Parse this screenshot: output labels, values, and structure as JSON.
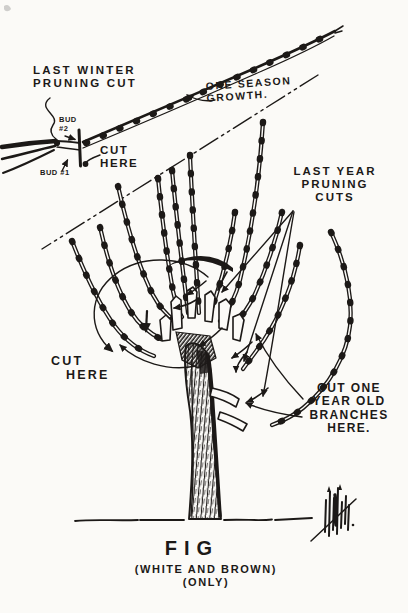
{
  "meta": {
    "paper_color": "#fbfaf7",
    "ink_color": "#1c1917",
    "illustration": "hand-drawn fig tree pruning diagram"
  },
  "inset": {
    "last_winter_line1": "LAST WINTER",
    "last_winter_line2": "PRUNING CUT",
    "bud2_line1": "BUD",
    "bud2_line2": "#2",
    "cut_here_line1": "CUT",
    "cut_here_line2": "HERE",
    "bud1": "BUD #1",
    "one_season_line1": "ONE SEASON",
    "one_season_line2": "GROWTH."
  },
  "tree": {
    "last_year_line1": "LAST YEAR",
    "last_year_line2": "PRUNING",
    "last_year_line3": "CUTS",
    "cut_here_line1": "CUT",
    "cut_here_line2": "HERE",
    "cut_one_line1": "CUT ONE",
    "cut_one_line2": "YEAR OLD",
    "cut_one_line3": "BRANCHES",
    "cut_one_line4": "HERE."
  },
  "caption": {
    "title": "FIG",
    "subtitle1": "(WHITE AND BROWN)",
    "subtitle2": "(ONLY)"
  }
}
